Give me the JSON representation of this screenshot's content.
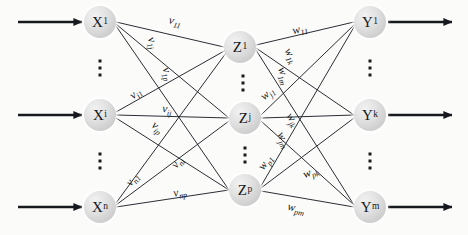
{
  "diagram": {
    "canvas": {
      "width": 468,
      "height": 235
    },
    "colors": {
      "background": "#fbfbfa",
      "node_fill": "#d8d8d8",
      "edge": "#1f2328",
      "text": "#101316"
    }
  },
  "layers": {
    "input": {
      "name": "input-layer",
      "nodes": [
        {
          "id": "x1",
          "base": "X",
          "sub": "1",
          "x": 100,
          "y": 22
        },
        {
          "id": "xi",
          "base": "X",
          "sub": "i",
          "x": 100,
          "y": 115
        },
        {
          "id": "xn",
          "base": "X",
          "sub": "n",
          "x": 100,
          "y": 207
        }
      ],
      "ellipses": [
        {
          "x": 100,
          "y": 68
        },
        {
          "x": 100,
          "y": 161
        }
      ]
    },
    "hidden": {
      "name": "hidden-layer",
      "nodes": [
        {
          "id": "z1",
          "base": "Z",
          "sub": "1",
          "x": 240,
          "y": 47
        },
        {
          "id": "zj",
          "base": "Z",
          "sub": "j",
          "x": 245,
          "y": 118
        },
        {
          "id": "zp",
          "base": "Z",
          "sub": "p",
          "x": 245,
          "y": 190
        }
      ],
      "ellipses": [
        {
          "x": 243,
          "y": 83
        },
        {
          "x": 245,
          "y": 155
        }
      ]
    },
    "output": {
      "name": "output-layer",
      "nodes": [
        {
          "id": "y1",
          "base": "Y",
          "sub": "1",
          "x": 370,
          "y": 22
        },
        {
          "id": "yk",
          "base": "Y",
          "sub": "k",
          "x": 370,
          "y": 115
        },
        {
          "id": "ym",
          "base": "Y",
          "sub": "m",
          "x": 370,
          "y": 207
        }
      ],
      "ellipses": [
        {
          "x": 370,
          "y": 68
        },
        {
          "x": 370,
          "y": 161
        }
      ]
    }
  },
  "input_arrows": [
    {
      "name": "input-arrow-x1",
      "x1": 18,
      "y1": 22,
      "x2": 82,
      "y2": 22
    },
    {
      "name": "input-arrow-xi",
      "x1": 18,
      "y1": 115,
      "x2": 82,
      "y2": 115
    },
    {
      "name": "input-arrow-xn",
      "x1": 18,
      "y1": 207,
      "x2": 82,
      "y2": 207
    }
  ],
  "output_arrows": [
    {
      "name": "output-arrow-y1",
      "x1": 388,
      "y1": 22,
      "x2": 452,
      "y2": 22
    },
    {
      "name": "output-arrow-yk",
      "x1": 388,
      "y1": 115,
      "x2": 452,
      "y2": 115
    },
    {
      "name": "output-arrow-ym",
      "x1": 388,
      "y1": 207,
      "x2": 452,
      "y2": 207
    }
  ],
  "edges_input_hidden": [
    {
      "name": "edge-x1-z1",
      "from": "x1",
      "to": "z1",
      "x1": 116,
      "y1": 22,
      "x2": 224,
      "y2": 47
    },
    {
      "name": "edge-x1-zj",
      "from": "x1",
      "to": "zj",
      "x1": 116,
      "y1": 24,
      "x2": 229,
      "y2": 118
    },
    {
      "name": "edge-x1-zp",
      "from": "x1",
      "to": "zp",
      "x1": 116,
      "y1": 26,
      "x2": 229,
      "y2": 190
    },
    {
      "name": "edge-xi-z1",
      "from": "xi",
      "to": "z1",
      "x1": 116,
      "y1": 112,
      "x2": 226,
      "y2": 50
    },
    {
      "name": "edge-xi-zj",
      "from": "xi",
      "to": "zj",
      "x1": 116,
      "y1": 115,
      "x2": 229,
      "y2": 118
    },
    {
      "name": "edge-xi-zp",
      "from": "xi",
      "to": "zp",
      "x1": 116,
      "y1": 118,
      "x2": 229,
      "y2": 190
    },
    {
      "name": "edge-xn-z1",
      "from": "xn",
      "to": "z1",
      "x1": 116,
      "y1": 203,
      "x2": 226,
      "y2": 53
    },
    {
      "name": "edge-xn-zj",
      "from": "xn",
      "to": "zj",
      "x1": 116,
      "y1": 205,
      "x2": 229,
      "y2": 121
    },
    {
      "name": "edge-xn-zp",
      "from": "xn",
      "to": "zp",
      "x1": 116,
      "y1": 207,
      "x2": 229,
      "y2": 190
    }
  ],
  "edges_hidden_output": [
    {
      "name": "edge-z1-y1",
      "from": "z1",
      "to": "y1",
      "x1": 256,
      "y1": 45,
      "x2": 354,
      "y2": 22
    },
    {
      "name": "edge-z1-yk",
      "from": "z1",
      "to": "yk",
      "x1": 256,
      "y1": 48,
      "x2": 354,
      "y2": 115
    },
    {
      "name": "edge-z1-ym",
      "from": "z1",
      "to": "ym",
      "x1": 256,
      "y1": 50,
      "x2": 354,
      "y2": 205
    },
    {
      "name": "edge-zj-y1",
      "from": "zj",
      "to": "y1",
      "x1": 261,
      "y1": 115,
      "x2": 354,
      "y2": 25
    },
    {
      "name": "edge-zj-yk",
      "from": "zj",
      "to": "yk",
      "x1": 261,
      "y1": 118,
      "x2": 354,
      "y2": 115
    },
    {
      "name": "edge-zj-ym",
      "from": "zj",
      "to": "ym",
      "x1": 261,
      "y1": 121,
      "x2": 354,
      "y2": 205
    },
    {
      "name": "edge-zp-y1",
      "from": "zp",
      "to": "y1",
      "x1": 261,
      "y1": 186,
      "x2": 354,
      "y2": 27
    },
    {
      "name": "edge-zp-yk",
      "from": "zp",
      "to": "yk",
      "x1": 261,
      "y1": 188,
      "x2": 354,
      "y2": 118
    },
    {
      "name": "edge-zp-ym",
      "from": "zp",
      "to": "ym",
      "x1": 261,
      "y1": 191,
      "x2": 354,
      "y2": 207
    }
  ],
  "weight_labels_input_hidden": [
    {
      "name": "weight-v11",
      "base": "v",
      "sub": "11",
      "x": 175,
      "y": 22,
      "rot": 12
    },
    {
      "name": "weight-v1j",
      "base": "v",
      "sub": "1j",
      "x": 152,
      "y": 43,
      "rot": 70
    },
    {
      "name": "weight-v1p",
      "base": "v",
      "sub": "1p",
      "x": 167,
      "y": 74,
      "rot": 70
    },
    {
      "name": "weight-vi1",
      "base": "v",
      "sub": "i1",
      "x": 136,
      "y": 94,
      "rot": -40
    },
    {
      "name": "weight-vij",
      "base": "v",
      "sub": "ij",
      "x": 167,
      "y": 110,
      "rot": 5
    },
    {
      "name": "weight-vip",
      "base": "v",
      "sub": "ip",
      "x": 157,
      "y": 128,
      "rot": 40
    },
    {
      "name": "weight-vn1",
      "base": "v",
      "sub": "n1",
      "x": 133,
      "y": 180,
      "rot": -52
    },
    {
      "name": "weight-vni",
      "base": "v",
      "sub": "ni",
      "x": 178,
      "y": 163,
      "rot": -52
    },
    {
      "name": "weight-vnp",
      "base": "v",
      "sub": "np",
      "x": 180,
      "y": 193,
      "rot": -11
    }
  ],
  "weight_labels_hidden_output": [
    {
      "name": "weight-w11",
      "base": "w",
      "sub": "11",
      "x": 300,
      "y": 30,
      "rot": -13
    },
    {
      "name": "weight-w1k",
      "base": "w",
      "sub": "1k",
      "x": 290,
      "y": 56,
      "rot": 62
    },
    {
      "name": "weight-w1m",
      "base": "w",
      "sub": "1m",
      "x": 283,
      "y": 76,
      "rot": 72
    },
    {
      "name": "weight-wj1",
      "base": "w",
      "sub": "j1",
      "x": 268,
      "y": 94,
      "rot": -40
    },
    {
      "name": "weight-wjk",
      "base": "w",
      "sub": "jk",
      "x": 292,
      "y": 120,
      "rot": 55
    },
    {
      "name": "weight-wjm",
      "base": "w",
      "sub": "jm",
      "x": 283,
      "y": 140,
      "rot": 62
    },
    {
      "name": "weight-wp1",
      "base": "w",
      "sub": "p1",
      "x": 266,
      "y": 163,
      "rot": -55
    },
    {
      "name": "weight-wpk",
      "base": "w",
      "sub": "pk",
      "x": 311,
      "y": 173,
      "rot": -22
    },
    {
      "name": "weight-wpm",
      "base": "w",
      "sub": "pm",
      "x": 296,
      "y": 209,
      "rot": 12
    }
  ]
}
